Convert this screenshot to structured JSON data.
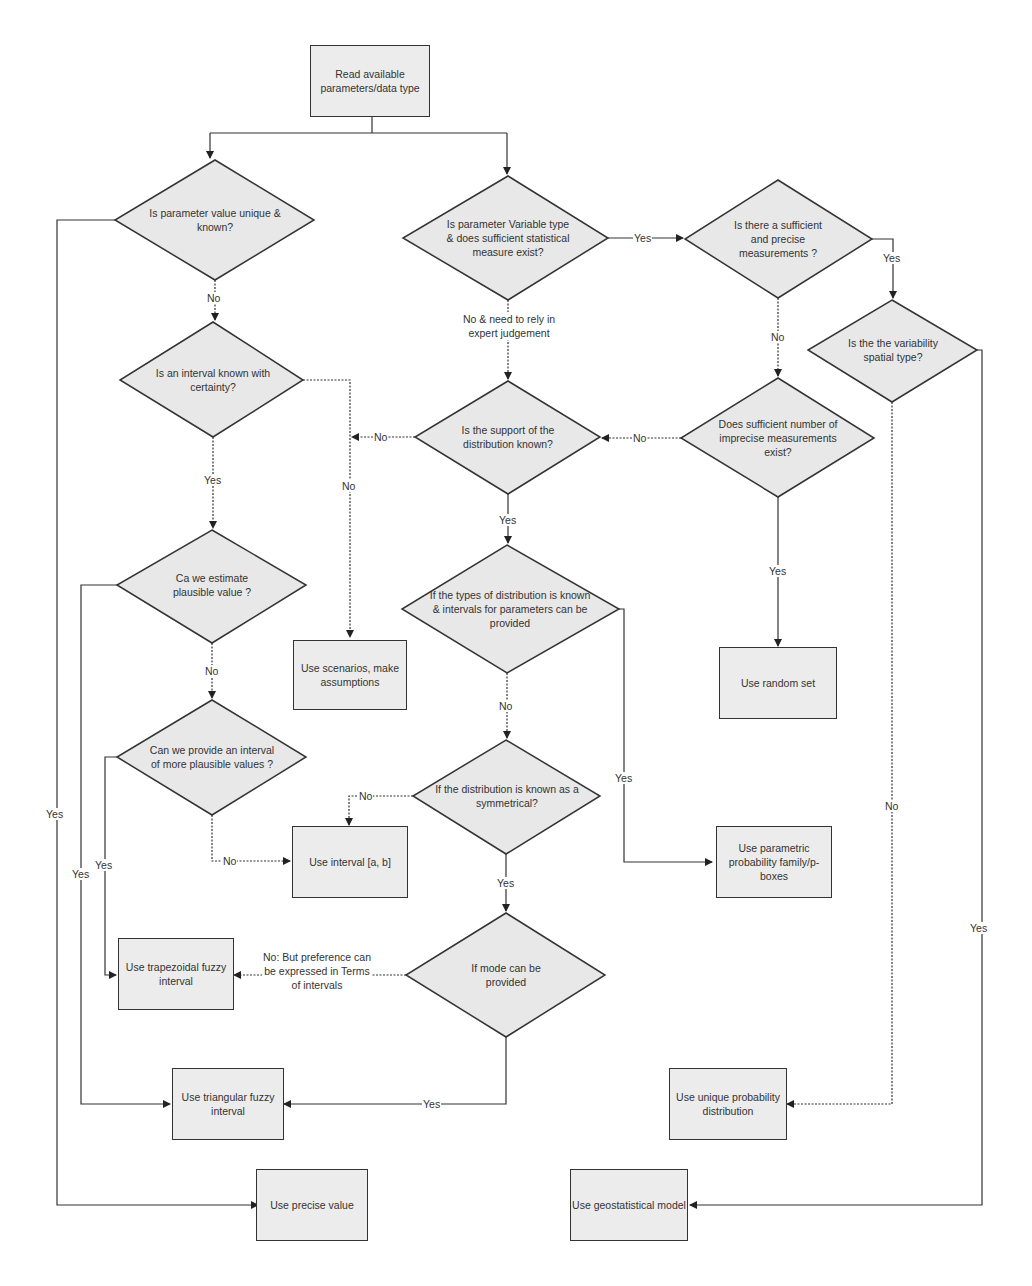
{
  "diagram": {
    "type": "flowchart",
    "colors": {
      "node_fill": "#e8e8e8",
      "stroke": "#333333",
      "background": "#ffffff"
    },
    "start": {
      "id": "read",
      "text": "Read available parameters/data type"
    },
    "decisions": {
      "unique_known": "Is parameter value unique & known?",
      "variable_type": "Is parameter Variable type & does sufficient statistical measure exist?",
      "sufficient_precise": "Is there a sufficient and precise measurements ?",
      "spatial": "Is the the variability spatial type?",
      "interval_certain": "Is an interval known with certainty?",
      "support_known": "Is the support of the distribution known?",
      "imprecise_exist": "Does sufficient number of imprecise measurements exist?",
      "estimate_plausible": "Ca we estimate plausible value ?",
      "types_known": "If the types of distribution is known & intervals for parameters can be provided",
      "more_plausible": "Can we provide an interval of more plausible values ?",
      "symmetrical": "If the distribution is known as a symmetrical?",
      "mode_provided": "If mode can be provided"
    },
    "outcomes": {
      "scenarios": "Use scenarios, make assumptions",
      "random_set": "Use random set",
      "interval_ab": "Use interval [a, b]",
      "parametric": "Use parametric probability family/p-boxes",
      "trapezoidal": "Use trapezoidal fuzzy interval",
      "triangular": "Use triangular fuzzy interval",
      "unique_prob": "Use unique probability distribution",
      "precise": "Use precise value",
      "geostat": "Use geostatistical model"
    },
    "edge_labels": {
      "yes": "Yes",
      "no": "No",
      "no_expert": "No & need to rely in expert judgement",
      "no_preference": "No: But preference can be expressed in Terms of intervals"
    }
  }
}
